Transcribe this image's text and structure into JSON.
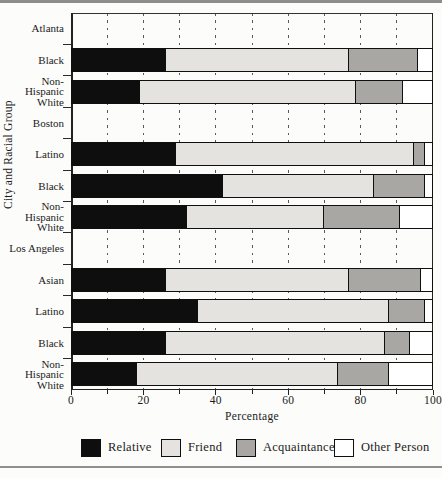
{
  "chart_data": {
    "type": "bar",
    "orientation": "horizontal",
    "stacked": true,
    "title": "",
    "xlabel": "Percentage",
    "ylabel": "City and Racial Group",
    "xlim": [
      0,
      100
    ],
    "x_ticks": [
      0,
      10,
      20,
      30,
      40,
      50,
      60,
      70,
      80,
      90,
      100
    ],
    "x_tick_labels": [
      "0",
      "20",
      "40",
      "60",
      "80",
      "100"
    ],
    "grid": "vertical-dashed-every-10",
    "series_names": [
      "Relative",
      "Friend",
      "Acquaintance",
      "Other Person"
    ],
    "series_colors": [
      "#0e0e0e",
      "#e4e3df",
      "#a8a7a3",
      "#ffffff"
    ],
    "groups": [
      {
        "city": "Atlanta",
        "bars": [
          {
            "label": "Black",
            "label_lines": [
              "Black"
            ],
            "values": [
              26,
              51,
              19,
              4
            ]
          },
          {
            "label": "Non-Hispanic White",
            "label_lines": [
              "Non-",
              "Hispanic",
              "White"
            ],
            "values": [
              19,
              60,
              13,
              8
            ]
          }
        ]
      },
      {
        "city": "Boston",
        "bars": [
          {
            "label": "Latino",
            "label_lines": [
              "Latino"
            ],
            "values": [
              29,
              66,
              3,
              2
            ]
          },
          {
            "label": "Black",
            "label_lines": [
              "Black"
            ],
            "values": [
              42,
              42,
              14,
              2
            ]
          },
          {
            "label": "Non-Hispanic White",
            "label_lines": [
              "Non-",
              "Hispanic",
              "White"
            ],
            "values": [
              32,
              38,
              21,
              9
            ]
          }
        ]
      },
      {
        "city": "Los Angeles",
        "bars": [
          {
            "label": "Asian",
            "label_lines": [
              "Asian"
            ],
            "values": [
              26,
              51,
              20,
              3
            ]
          },
          {
            "label": "Latino",
            "label_lines": [
              "Latino"
            ],
            "values": [
              35,
              53,
              10,
              2
            ]
          },
          {
            "label": "Black",
            "label_lines": [
              "Black"
            ],
            "values": [
              26,
              61,
              7,
              6
            ]
          },
          {
            "label": "Non-Hispanic White",
            "label_lines": [
              "Non-",
              "Hispanic",
              "White"
            ],
            "values": [
              18,
              56,
              14,
              12
            ]
          }
        ]
      }
    ],
    "legend": [
      {
        "label": "Relative",
        "color": "#0e0e0e"
      },
      {
        "label": "Friend",
        "color": "#e4e3df"
      },
      {
        "label": "Acquaintance",
        "color": "#a8a7a3"
      },
      {
        "label": "Other Person",
        "color": "#ffffff"
      }
    ],
    "legend_position": "bottom"
  }
}
